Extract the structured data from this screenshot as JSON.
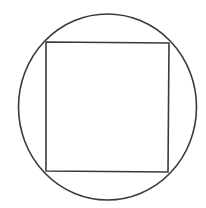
{
  "diagram": {
    "background": "#ffffff",
    "stroke_color": "#3a3a3a",
    "stroke_width": 1.6,
    "circle": {
      "cx": 107.5,
      "cy": 107,
      "rx": 89,
      "ry": 93
    },
    "square": {
      "points": [
        [
          46,
          42
        ],
        [
          169,
          43
        ],
        [
          168,
          172
        ],
        [
          46,
          171
        ]
      ]
    }
  }
}
